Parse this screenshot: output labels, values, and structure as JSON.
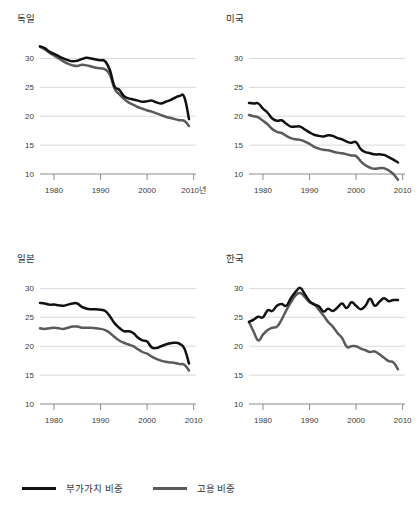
{
  "figure": {
    "background": "#ffffff",
    "colors": {
      "value_added": "#111111",
      "employment": "#5a5a5a",
      "gridline": "#c8c8c8",
      "axis": "#6e6e6e"
    }
  },
  "legend": {
    "position": "bottom-left",
    "items": [
      {
        "label": "부가가치 비중",
        "color": "#111111",
        "icon": "line-swatch-icon"
      },
      {
        "label": "고용 비중",
        "color": "#5a5a5a",
        "icon": "line-swatch-icon"
      }
    ]
  },
  "chart_data": [
    {
      "type": "line",
      "title": "독일",
      "xlabel": "",
      "ylabel": "",
      "x_axis_unit_label": "2010년",
      "grid": true,
      "xlim": [
        1977,
        2010.5
      ],
      "ylim": [
        10,
        32.5
      ],
      "yticks": [
        10,
        15,
        20,
        25,
        30
      ],
      "xticks": [
        1980,
        1990,
        2000,
        2010
      ],
      "xticklabels": [
        "1980",
        "1990",
        "2000",
        "2010년"
      ],
      "x": [
        1977,
        1978,
        1979,
        1980,
        1981,
        1982,
        1983,
        1984,
        1985,
        1986,
        1987,
        1988,
        1989,
        1990,
        1991,
        1992,
        1993,
        1994,
        1995,
        1996,
        1997,
        1998,
        1999,
        2000,
        2001,
        2002,
        2003,
        2004,
        2005,
        2006,
        2007,
        2008,
        2009
      ],
      "series": [
        {
          "name": "부가가치 비중",
          "color": "#111111",
          "values": [
            32.1,
            31.8,
            31.2,
            30.8,
            30.4,
            30.0,
            29.7,
            29.5,
            29.6,
            29.9,
            30.1,
            30.0,
            29.8,
            29.7,
            29.5,
            28.0,
            25.2,
            24.6,
            23.5,
            23.1,
            22.9,
            22.7,
            22.5,
            22.6,
            22.7,
            22.4,
            22.2,
            22.5,
            22.8,
            23.2,
            23.5,
            23.3,
            19.5
          ]
        },
        {
          "name": "고용 비중",
          "color": "#5a5a5a",
          "values": [
            32.0,
            31.6,
            31.0,
            30.5,
            30.0,
            29.5,
            29.1,
            28.8,
            28.7,
            28.9,
            28.8,
            28.6,
            28.4,
            28.3,
            28.1,
            27.2,
            24.8,
            23.8,
            23.0,
            22.4,
            22.0,
            21.6,
            21.3,
            21.0,
            20.8,
            20.5,
            20.2,
            19.9,
            19.7,
            19.5,
            19.3,
            19.2,
            18.3
          ]
        }
      ]
    },
    {
      "type": "line",
      "title": "미국",
      "xlabel": "",
      "ylabel": "",
      "grid": true,
      "xlim": [
        1977,
        2010.5
      ],
      "ylim": [
        10,
        32.5
      ],
      "yticks": [
        10,
        15,
        20,
        25,
        30
      ],
      "xticks": [
        1980,
        1990,
        2000,
        2010
      ],
      "xticklabels": [
        "1980",
        "1990",
        "2000",
        "2010"
      ],
      "x": [
        1977,
        1978,
        1979,
        1980,
        1981,
        1982,
        1983,
        1984,
        1985,
        1986,
        1987,
        1988,
        1989,
        1990,
        1991,
        1992,
        1993,
        1994,
        1995,
        1996,
        1997,
        1998,
        1999,
        2000,
        2001,
        2002,
        2003,
        2004,
        2005,
        2006,
        2007,
        2008,
        2009
      ],
      "series": [
        {
          "name": "부가가치 비중",
          "color": "#111111",
          "values": [
            22.3,
            22.2,
            22.2,
            21.3,
            20.6,
            19.6,
            19.2,
            19.3,
            18.7,
            18.2,
            18.2,
            18.2,
            17.7,
            17.2,
            16.8,
            16.6,
            16.5,
            16.7,
            16.6,
            16.2,
            16.0,
            15.6,
            15.4,
            15.5,
            14.3,
            13.8,
            13.6,
            13.4,
            13.4,
            13.3,
            12.9,
            12.5,
            12.0
          ]
        },
        {
          "name": "고용 비중",
          "color": "#5a5a5a",
          "values": [
            20.2,
            20.0,
            19.8,
            19.2,
            18.6,
            17.8,
            17.3,
            17.1,
            16.6,
            16.2,
            16.0,
            15.9,
            15.6,
            15.2,
            14.7,
            14.4,
            14.2,
            14.1,
            13.9,
            13.7,
            13.6,
            13.4,
            13.2,
            13.1,
            12.2,
            11.5,
            11.1,
            10.9,
            11.0,
            11.0,
            10.6,
            10.0,
            9.0
          ]
        }
      ]
    },
    {
      "type": "line",
      "title": "일본",
      "xlabel": "",
      "ylabel": "",
      "grid": true,
      "xlim": [
        1977,
        2010.5
      ],
      "ylim": [
        10,
        32.5
      ],
      "yticks": [
        10,
        15,
        20,
        25,
        30
      ],
      "xticks": [
        1980,
        1990,
        2000,
        2010
      ],
      "xticklabels": [
        "1980",
        "1990",
        "2000",
        "2010"
      ],
      "x": [
        1977,
        1978,
        1979,
        1980,
        1981,
        1982,
        1983,
        1984,
        1985,
        1986,
        1987,
        1988,
        1989,
        1990,
        1991,
        1992,
        1993,
        1994,
        1995,
        1996,
        1997,
        1998,
        1999,
        2000,
        2001,
        2002,
        2003,
        2004,
        2005,
        2006,
        2007,
        2008,
        2009
      ],
      "series": [
        {
          "name": "부가가치 비중",
          "color": "#111111",
          "values": [
            27.5,
            27.4,
            27.2,
            27.2,
            27.1,
            27.0,
            27.2,
            27.4,
            27.4,
            26.8,
            26.5,
            26.4,
            26.4,
            26.3,
            26.1,
            25.2,
            24.0,
            23.2,
            22.6,
            22.6,
            22.3,
            21.5,
            21.0,
            20.8,
            19.8,
            19.7,
            20.0,
            20.3,
            20.5,
            20.6,
            20.4,
            19.6,
            17.0
          ]
        },
        {
          "name": "고용 비중",
          "color": "#5a5a5a",
          "values": [
            23.1,
            23.0,
            23.1,
            23.2,
            23.1,
            23.0,
            23.2,
            23.4,
            23.4,
            23.2,
            23.2,
            23.2,
            23.1,
            23.0,
            22.8,
            22.3,
            21.6,
            21.0,
            20.6,
            20.3,
            20.0,
            19.5,
            19.0,
            18.7,
            18.2,
            17.8,
            17.5,
            17.3,
            17.2,
            17.1,
            16.9,
            16.8,
            15.8
          ]
        }
      ]
    },
    {
      "type": "line",
      "title": "한국",
      "xlabel": "",
      "ylabel": "",
      "grid": true,
      "xlim": [
        1977,
        2010.5
      ],
      "ylim": [
        10,
        32.5
      ],
      "yticks": [
        10,
        15,
        20,
        25,
        30
      ],
      "xticks": [
        1980,
        1990,
        2000,
        2010
      ],
      "xticklabels": [
        "1980",
        "1990",
        "2000",
        "2010"
      ],
      "x": [
        1977,
        1978,
        1979,
        1980,
        1981,
        1982,
        1983,
        1984,
        1985,
        1986,
        1987,
        1988,
        1989,
        1990,
        1991,
        1992,
        1993,
        1994,
        1995,
        1996,
        1997,
        1998,
        1999,
        2000,
        2001,
        2002,
        2003,
        2004,
        2005,
        2006,
        2007,
        2008,
        2009
      ],
      "series": [
        {
          "name": "부가가치 비중",
          "color": "#111111",
          "values": [
            24.2,
            24.6,
            25.1,
            25.0,
            26.2,
            26.1,
            27.0,
            27.3,
            27.0,
            28.3,
            29.4,
            30.1,
            29.0,
            27.8,
            27.2,
            26.9,
            26.0,
            26.5,
            26.1,
            26.7,
            27.4,
            26.6,
            27.6,
            27.0,
            26.4,
            27.0,
            28.2,
            27.0,
            27.7,
            28.3,
            27.8,
            28.0,
            28.0
          ]
        },
        {
          "name": "고용 비중",
          "color": "#5a5a5a",
          "values": [
            24.2,
            22.5,
            21.0,
            22.0,
            22.8,
            23.2,
            23.4,
            24.6,
            26.2,
            27.6,
            28.8,
            29.2,
            28.5,
            27.6,
            27.3,
            26.3,
            25.3,
            24.2,
            23.4,
            22.3,
            21.4,
            19.9,
            20.0,
            20.0,
            19.6,
            19.3,
            19.0,
            19.1,
            18.6,
            18.0,
            17.4,
            17.2,
            16.0
          ]
        }
      ]
    }
  ]
}
